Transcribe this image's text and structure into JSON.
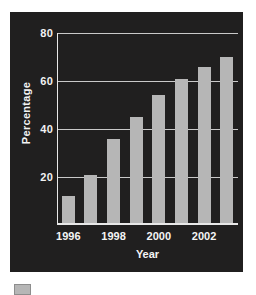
{
  "chart_data": {
    "type": "bar",
    "title": "",
    "subtitle": "",
    "xlabel": "Year",
    "ylabel": "Percentage",
    "categories": [
      "1996",
      "1997",
      "1998",
      "1999",
      "2000",
      "2001",
      "2002",
      "2003"
    ],
    "tick_labels_x": [
      "1996",
      "1998",
      "2000",
      "2002"
    ],
    "tick_label_indices_x": [
      0,
      2,
      4,
      6
    ],
    "values": [
      12,
      21,
      36,
      45,
      54,
      61,
      66,
      70
    ],
    "ylim": [
      0,
      80
    ],
    "yticks": [
      20,
      40,
      60,
      80
    ],
    "ytick_labels": [
      "20",
      "40",
      "60",
      "80"
    ],
    "grid": true,
    "grid_axis": "y",
    "legend": false,
    "legend_position": "below-figure",
    "series": [
      {
        "name": "Percentage",
        "values": [
          12,
          21,
          36,
          45,
          54,
          61,
          66,
          70
        ]
      }
    ]
  },
  "style": {
    "panel_background": "#201f1f",
    "figure_background": "#ffffff",
    "bar_color": "#b6b6b6",
    "grid_color": "#c9c9c9",
    "axis_color": "#e8e8e8",
    "text_color": "#f4f4f4"
  },
  "legend": {
    "swatch_label": ""
  }
}
